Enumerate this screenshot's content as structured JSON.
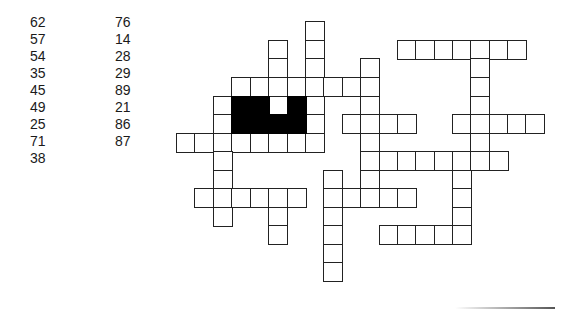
{
  "puzzle": {
    "type": "number fill-in crossword",
    "numbers_column_1": [
      "62",
      "57",
      "54",
      "35",
      "45",
      "49",
      "25",
      "71",
      "38"
    ],
    "numbers_column_2": [
      "76",
      "14",
      "28",
      "29",
      "89",
      "21",
      "86",
      "87"
    ]
  },
  "grid": {
    "cell_color": "#ffffff",
    "border_color": "#222222",
    "black_color": "#000000",
    "cols_x": [
      176,
      194,
      213,
      231,
      250,
      268,
      287,
      305,
      323,
      342,
      360,
      379,
      397,
      415,
      434,
      452,
      470,
      489,
      507,
      525
    ],
    "rows_y": [
      21,
      40,
      58,
      77,
      96,
      114,
      133,
      151,
      170,
      188,
      207,
      225,
      244,
      262
    ],
    "white_cells": [
      [
        7,
        0
      ],
      [
        7,
        1
      ],
      [
        7,
        2
      ],
      [
        5,
        1
      ],
      [
        5,
        2
      ],
      [
        12,
        1
      ],
      [
        13,
        1
      ],
      [
        14,
        1
      ],
      [
        15,
        1
      ],
      [
        16,
        1
      ],
      [
        17,
        1
      ],
      [
        18,
        1
      ],
      [
        16,
        2
      ],
      [
        16,
        3
      ],
      [
        3,
        3
      ],
      [
        4,
        3
      ],
      [
        5,
        3
      ],
      [
        6,
        3
      ],
      [
        7,
        3
      ],
      [
        8,
        3
      ],
      [
        9,
        3
      ],
      [
        10,
        3
      ],
      [
        10,
        2
      ],
      [
        2,
        4
      ],
      [
        7,
        4
      ],
      [
        10,
        4
      ],
      [
        16,
        4
      ],
      [
        5,
        4
      ],
      [
        2,
        5
      ],
      [
        7,
        5
      ],
      [
        9,
        5
      ],
      [
        10,
        5
      ],
      [
        11,
        5
      ],
      [
        12,
        5
      ],
      [
        15,
        5
      ],
      [
        16,
        5
      ],
      [
        17,
        5
      ],
      [
        18,
        5
      ],
      [
        19,
        5
      ],
      [
        0,
        6
      ],
      [
        1,
        6
      ],
      [
        2,
        6
      ],
      [
        3,
        6
      ],
      [
        4,
        6
      ],
      [
        5,
        6
      ],
      [
        6,
        6
      ],
      [
        7,
        6
      ],
      [
        10,
        6
      ],
      [
        16,
        6
      ],
      [
        2,
        7
      ],
      [
        10,
        7
      ],
      [
        11,
        7
      ],
      [
        12,
        7
      ],
      [
        13,
        7
      ],
      [
        14,
        7
      ],
      [
        15,
        7
      ],
      [
        16,
        7
      ],
      [
        17,
        7
      ],
      [
        2,
        8
      ],
      [
        8,
        8
      ],
      [
        10,
        8
      ],
      [
        15,
        8
      ],
      [
        1,
        9
      ],
      [
        2,
        9
      ],
      [
        3,
        9
      ],
      [
        4,
        9
      ],
      [
        5,
        9
      ],
      [
        6,
        9
      ],
      [
        8,
        9
      ],
      [
        9,
        9
      ],
      [
        10,
        9
      ],
      [
        11,
        9
      ],
      [
        12,
        9
      ],
      [
        15,
        9
      ],
      [
        2,
        10
      ],
      [
        5,
        10
      ],
      [
        8,
        10
      ],
      [
        15,
        10
      ],
      [
        5,
        11
      ],
      [
        8,
        11
      ],
      [
        11,
        11
      ],
      [
        12,
        11
      ],
      [
        13,
        11
      ],
      [
        14,
        11
      ],
      [
        15,
        11
      ],
      [
        8,
        12
      ],
      [
        8,
        13
      ]
    ],
    "black_cells": [
      [
        3,
        4
      ],
      [
        4,
        4
      ],
      [
        6,
        4
      ],
      [
        3,
        5
      ],
      [
        4,
        5
      ],
      [
        5,
        5
      ],
      [
        6,
        5
      ]
    ]
  }
}
